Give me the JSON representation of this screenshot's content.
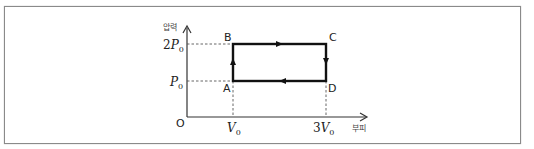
{
  "diagram": {
    "type": "pressure-volume cycle (P-V diagram)",
    "axes": {
      "y_label": "압력",
      "x_label": "부피",
      "origin_label": "O",
      "y_ticks": [
        {
          "label_coef": "2",
          "label_var": "P",
          "label_sub": "0"
        },
        {
          "label_coef": "",
          "label_var": "P",
          "label_sub": "0"
        }
      ],
      "x_ticks": [
        {
          "label_coef": "",
          "label_var": "V",
          "label_sub": "0"
        },
        {
          "label_coef": "3",
          "label_var": "V",
          "label_sub": "0"
        }
      ]
    },
    "points": [
      {
        "name": "A",
        "volume": "V0",
        "pressure": "P0"
      },
      {
        "name": "B",
        "volume": "V0",
        "pressure": "2P0"
      },
      {
        "name": "C",
        "volume": "3V0",
        "pressure": "2P0"
      },
      {
        "name": "D",
        "volume": "3V0",
        "pressure": "P0"
      }
    ],
    "process_order": [
      "A",
      "B",
      "C",
      "D",
      "A"
    ],
    "colors": {
      "cycle_line": "#111111",
      "axis": "#333333",
      "guide_dash": "#555555",
      "frame": "#8a8a8a"
    }
  }
}
